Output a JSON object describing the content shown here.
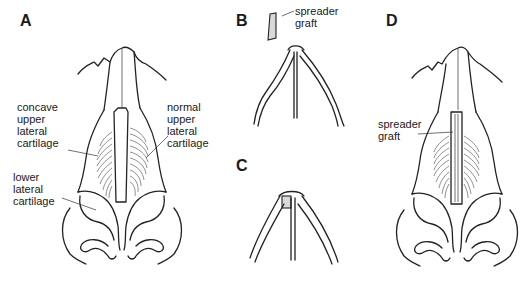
{
  "figure": {
    "panels": [
      {
        "id": "A",
        "label": "A",
        "annotations": [
          {
            "name": "concave-upper-lateral-cartilage",
            "text": "concave\nupper\nlateral\ncartilage"
          },
          {
            "name": "normal-upper-lateral-cartilage",
            "text": "normal\nupper\nlateral\ncartilage"
          },
          {
            "name": "lower-lateral-cartilage",
            "text": "lower\nlateral\ncartilage"
          }
        ]
      },
      {
        "id": "B",
        "label": "B",
        "annotations": [
          {
            "name": "spreader-graft",
            "text": "spreader\ngraft"
          }
        ]
      },
      {
        "id": "C",
        "label": "C",
        "annotations": []
      },
      {
        "id": "D",
        "label": "D",
        "annotations": [
          {
            "name": "spreader-graft",
            "text": "spreader\ngraft"
          }
        ]
      }
    ],
    "colors": {
      "line": "#222222",
      "graft_fill": "#d9d9d9"
    }
  }
}
